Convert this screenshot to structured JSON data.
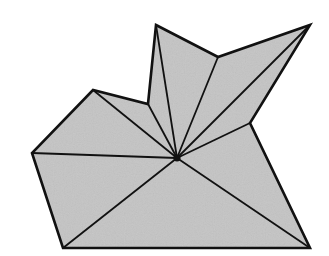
{
  "diagram": {
    "type": "star-shaped polygon with fan triangulation from kernel point",
    "colors": {
      "fill": "#c4c4c4",
      "stroke": "#111111",
      "background": "#ffffff"
    },
    "polygon": [
      [
        156,
        25
      ],
      [
        218,
        57
      ],
      [
        310,
        25
      ],
      [
        250,
        123
      ],
      [
        310,
        248
      ],
      [
        63,
        248
      ],
      [
        32,
        153
      ],
      [
        93,
        90
      ],
      [
        148,
        104
      ]
    ],
    "kernel_point": [
      177,
      158
    ]
  }
}
